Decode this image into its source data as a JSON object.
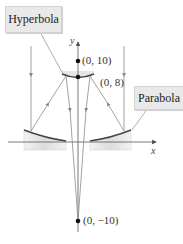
{
  "labels": {
    "hyperbola": "Hyperbola",
    "parabola": "Parabola"
  },
  "axes": {
    "x_label": "x",
    "y_label": "y"
  },
  "points": [
    {
      "label": "(0, 10)",
      "x": 0,
      "y": 10
    },
    {
      "label": "(0, 8)",
      "x": 0,
      "y": 8
    },
    {
      "label": "(0, −10)",
      "x": 0,
      "y": -10
    }
  ],
  "colors": {
    "axis": "#555555",
    "ray": "#8a8a8a",
    "mirror": "#444444",
    "mirror_shade": "#e4e4e4",
    "label_bg": "#e9e9e9",
    "point": "#111111"
  }
}
